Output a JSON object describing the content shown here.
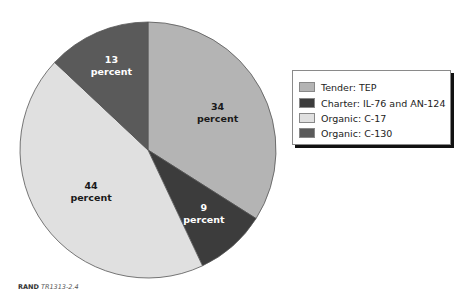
{
  "chart_data": {
    "type": "pie",
    "title": "",
    "categories": [
      "Tender: TEP",
      "Charter: IL-76 and AN-124",
      "Organic: C-17",
      "Organic: C-130"
    ],
    "values": [
      34,
      9,
      44,
      13
    ],
    "unit": "percent",
    "colors": [
      "#b4b4b4",
      "#3c3c3c",
      "#e0e0e0",
      "#5a5a5a"
    ],
    "label_colors": [
      "#1a1a1a",
      "#ffffff",
      "#1a1a1a",
      "#ffffff"
    ],
    "start_angle": "12 o'clock, clockwise",
    "legend_position": "right",
    "slice_labels": [
      {
        "value": "34",
        "unit": "percent"
      },
      {
        "value": "9",
        "unit": "percent"
      },
      {
        "value": "44",
        "unit": "percent"
      },
      {
        "value": "13",
        "unit": "percent"
      }
    ]
  },
  "legend": {
    "items": [
      {
        "label": "Tender: TEP",
        "color": "#b4b4b4"
      },
      {
        "label": "Charter: IL-76 and AN-124",
        "color": "#3c3c3c"
      },
      {
        "label": "Organic: C-17",
        "color": "#e0e0e0"
      },
      {
        "label": "Organic: C-130",
        "color": "#5a5a5a"
      }
    ]
  },
  "source": {
    "org": "RAND",
    "id": "TR1313-2.4"
  }
}
